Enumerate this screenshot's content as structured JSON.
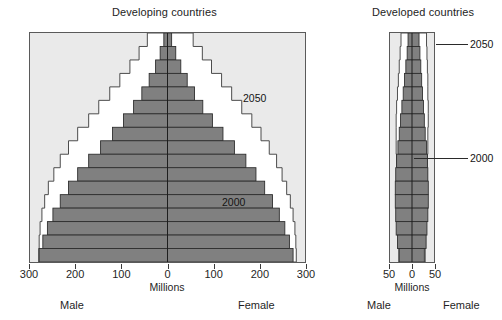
{
  "chart_data": [
    {
      "type": "bar",
      "subtype": "population-pyramid",
      "title": "Developing countries",
      "xlabel": "Millions",
      "ylabel": "",
      "xlim": [
        -300,
        300
      ],
      "xticks": [
        -300,
        -200,
        -100,
        0,
        100,
        200,
        300
      ],
      "xticklabels": [
        "300",
        "200",
        "100",
        "0",
        "100",
        "200",
        "300"
      ],
      "grid": false,
      "legend_position": "in-plot-annotation",
      "side_labels": {
        "left": "Male",
        "right": "Female"
      },
      "annotations": [
        {
          "text": "2050",
          "x": 185,
          "y_band": 4
        },
        {
          "text": "2000",
          "x": 120,
          "y_band": 12
        }
      ],
      "age_groups": [
        "80+",
        "75-79",
        "70-74",
        "65-69",
        "60-64",
        "55-59",
        "50-54",
        "45-49",
        "40-44",
        "35-39",
        "30-34",
        "25-29",
        "20-24",
        "15-19",
        "10-14",
        "5-9",
        "0-4"
      ],
      "series": [
        {
          "name": "2000",
          "fill": "#808080",
          "male": [
            8,
            16,
            26,
            40,
            56,
            74,
            96,
            120,
            146,
            172,
            196,
            216,
            234,
            250,
            262,
            272,
            280
          ],
          "female": [
            9,
            18,
            29,
            43,
            59,
            77,
            98,
            121,
            146,
            171,
            193,
            212,
            229,
            244,
            256,
            266,
            274
          ]
        },
        {
          "name": "2050",
          "fill": "#ffffff",
          "male": [
            44,
            62,
            82,
            104,
            126,
            150,
            172,
            196,
            216,
            234,
            248,
            260,
            268,
            274,
            278,
            280,
            281
          ],
          "female": [
            56,
            76,
            96,
            118,
            140,
            162,
            184,
            204,
            222,
            238,
            250,
            260,
            268,
            274,
            278,
            280,
            281
          ]
        }
      ]
    },
    {
      "type": "bar",
      "subtype": "population-pyramid",
      "title": "Developed countries",
      "xlabel": "Millions",
      "ylabel": "",
      "xlim": [
        -50,
        50
      ],
      "xticks": [
        -50,
        0,
        50
      ],
      "xticklabels": [
        "50",
        "0",
        "50"
      ],
      "grid": false,
      "legend_position": "callout",
      "side_labels": {
        "left": "Male",
        "right": "Female"
      },
      "annotations": [
        {
          "text": "2050",
          "callout": true
        },
        {
          "text": "2000",
          "callout": true
        }
      ],
      "age_groups": [
        "80+",
        "75-79",
        "70-74",
        "65-69",
        "60-64",
        "55-59",
        "50-54",
        "45-49",
        "40-44",
        "35-39",
        "30-34",
        "25-29",
        "20-24",
        "15-19",
        "10-14",
        "5-9",
        "0-4"
      ],
      "series": [
        {
          "name": "2000",
          "fill": "#808080",
          "male": [
            9,
            11,
            14,
            17,
            20,
            23,
            26,
            29,
            32,
            35,
            37,
            38,
            38,
            37,
            36,
            33,
            29
          ],
          "female": [
            16,
            18,
            20,
            22,
            24,
            26,
            28,
            30,
            33,
            35,
            36,
            37,
            37,
            36,
            34,
            32,
            28
          ]
        },
        {
          "name": "2050",
          "fill": "#ffffff",
          "male": [
            25,
            27,
            29,
            31,
            33,
            35,
            36,
            36,
            36,
            35,
            34,
            33,
            32,
            32,
            31,
            31,
            30
          ],
          "female": [
            33,
            34,
            35,
            36,
            36,
            37,
            37,
            36,
            36,
            35,
            34,
            33,
            32,
            32,
            31,
            31,
            30
          ]
        }
      ]
    }
  ],
  "left": {
    "title": "Developing countries",
    "xlabel": "Millions",
    "male_label": "Male",
    "female_label": "Female",
    "tick_labels": [
      "300",
      "200",
      "100",
      "0",
      "100",
      "200",
      "300"
    ],
    "annot_2050": "2050",
    "annot_2000": "2000"
  },
  "right": {
    "title": "Developed countries",
    "xlabel": "Millions",
    "male_label": "Male",
    "female_label": "Female",
    "tick_labels": [
      "50",
      "0",
      "50"
    ],
    "annot_2050": "2050",
    "annot_2000": "2000"
  },
  "colors": {
    "bar_2000": "#808080",
    "area_2050": "#ffffff",
    "plot_background": "#eaeaea",
    "outline": "#4a4a4a",
    "text": "#1a1a1a"
  }
}
